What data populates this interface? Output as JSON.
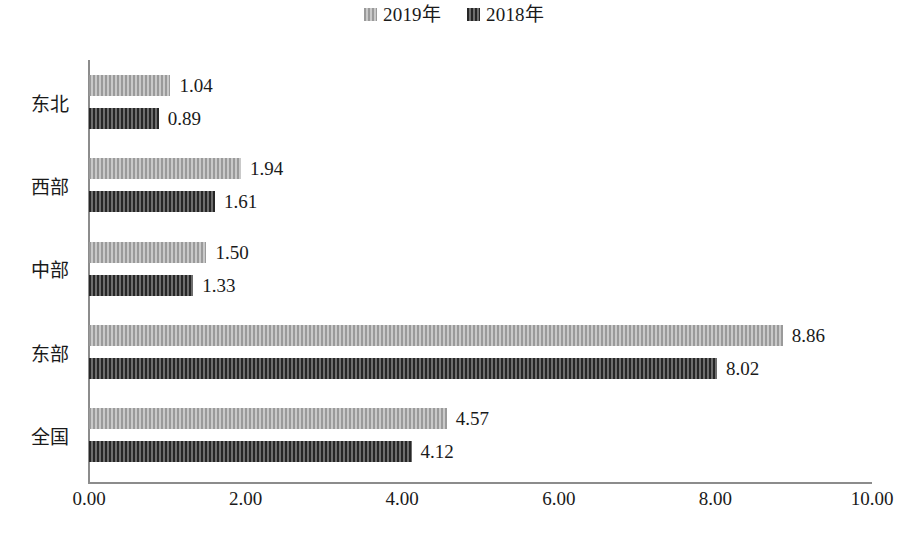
{
  "chart_data": {
    "type": "bar",
    "orientation": "horizontal",
    "title": "",
    "xlabel": "",
    "ylabel": "",
    "xlim": [
      0,
      10
    ],
    "grid": false,
    "legend_position": "top-center",
    "categories": [
      "东北",
      "西部",
      "中部",
      "东部",
      "全国"
    ],
    "tick_labels": [
      "0.00",
      "2.00",
      "4.00",
      "6.00",
      "8.00",
      "10.00"
    ],
    "tick_values": [
      0,
      2,
      4,
      6,
      8,
      10
    ],
    "series": [
      {
        "name": "2019年",
        "color": "#b0b0b0",
        "values": [
          1.04,
          1.94,
          1.5,
          8.86,
          4.57
        ],
        "labels": [
          "1.04",
          "1.94",
          "1.50",
          "8.86",
          "4.57"
        ]
      },
      {
        "name": "2018年",
        "color": "#4d4d4d",
        "values": [
          0.89,
          1.61,
          1.33,
          8.02,
          4.12
        ],
        "labels": [
          "0.89",
          "1.61",
          "1.33",
          "8.02",
          "4.12"
        ]
      }
    ]
  },
  "legend": {
    "entries": [
      {
        "label": "2019年",
        "swatch": "legend-swatch-2019"
      },
      {
        "label": "2018年",
        "swatch": "legend-swatch-2018"
      }
    ]
  },
  "axis": {
    "ticks": [
      {
        "label": "0.00"
      },
      {
        "label": "2.00"
      },
      {
        "label": "4.00"
      },
      {
        "label": "6.00"
      },
      {
        "label": "8.00"
      },
      {
        "label": "10.00"
      }
    ]
  },
  "categories": [
    {
      "label": "东北"
    },
    {
      "label": "西部"
    },
    {
      "label": "中部"
    },
    {
      "label": "东部"
    },
    {
      "label": "全国"
    }
  ],
  "bars": [
    {
      "cat": "东北",
      "series": "2019年",
      "value": 1.04,
      "label": "1.04"
    },
    {
      "cat": "东北",
      "series": "2018年",
      "value": 0.89,
      "label": "0.89"
    },
    {
      "cat": "西部",
      "series": "2019年",
      "value": 1.94,
      "label": "1.94"
    },
    {
      "cat": "西部",
      "series": "2018年",
      "value": 1.61,
      "label": "1.61"
    },
    {
      "cat": "中部",
      "series": "2019年",
      "value": 1.5,
      "label": "1.50"
    },
    {
      "cat": "中部",
      "series": "2018年",
      "value": 1.33,
      "label": "1.33"
    },
    {
      "cat": "东部",
      "series": "2019年",
      "value": 8.86,
      "label": "8.86"
    },
    {
      "cat": "东部",
      "series": "2018年",
      "value": 8.02,
      "label": "8.02"
    },
    {
      "cat": "全国",
      "series": "2019年",
      "value": 4.57,
      "label": "4.57"
    },
    {
      "cat": "全国",
      "series": "2018年",
      "value": 4.12,
      "label": "4.12"
    }
  ],
  "footer": {
    "caption": ""
  }
}
